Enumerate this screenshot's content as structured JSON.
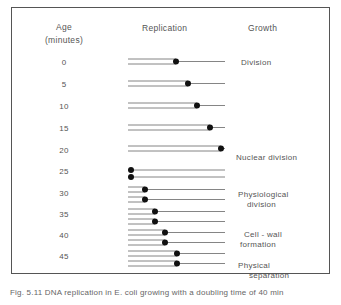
{
  "headers": {
    "age_line1": "Age",
    "age_line2": "(minutes)",
    "replication": "Replication",
    "growth": "Growth"
  },
  "ages": [
    "0",
    "5",
    "10",
    "15",
    "20",
    "25",
    "30",
    "35",
    "40",
    "45"
  ],
  "growth_events": [
    {
      "line1": "Division",
      "line2": ""
    },
    {
      "line1": "Nuclear division",
      "line2": ""
    },
    {
      "line1": "Physiological",
      "line2": "division"
    },
    {
      "line1": "Cell - wall",
      "line2": "formation"
    },
    {
      "line1": "Physical",
      "line2": "separation"
    }
  ],
  "replication_rows": [
    {
      "age": 0,
      "strands": [
        {
          "fork_x": 176
        }
      ]
    },
    {
      "age": 5,
      "strands": [
        {
          "fork_x": 188
        }
      ]
    },
    {
      "age": 10,
      "strands": [
        {
          "fork_x": 197
        }
      ]
    },
    {
      "age": 15,
      "strands": [
        {
          "fork_x": 210
        }
      ]
    },
    {
      "age": 20,
      "strands": [
        {
          "fork_x": 221
        }
      ]
    },
    {
      "age": 25,
      "strands": [
        {
          "origin_x": 131
        },
        {
          "origin_x": 131
        }
      ]
    },
    {
      "age": 30,
      "strands": [
        {
          "fork_x": 145
        },
        {
          "fork_x": 145
        }
      ]
    },
    {
      "age": 35,
      "strands": [
        {
          "fork_x": 155
        },
        {
          "fork_x": 155
        }
      ]
    },
    {
      "age": 40,
      "strands": [
        {
          "fork_x": 165
        },
        {
          "fork_x": 165
        }
      ]
    },
    {
      "age": 45,
      "strands": [
        {
          "fork_x": 177
        },
        {
          "fork_x": 177
        }
      ]
    }
  ],
  "caption": "Fig. 5.11  DNA replication in E. coli growing with a doubling time of 40 min"
}
